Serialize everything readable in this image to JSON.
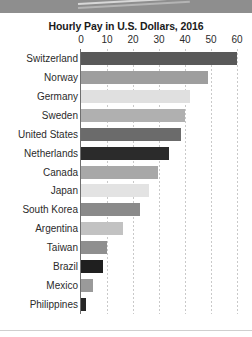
{
  "chart_data": {
    "type": "bar",
    "orientation": "horizontal",
    "title": "Hourly Pay in U.S. Dollars, 2016",
    "xlabel": "",
    "ylabel": "",
    "xlim": [
      0,
      60
    ],
    "xticks": [
      0,
      10,
      20,
      30,
      40,
      50,
      60
    ],
    "grid": true,
    "legend": "none",
    "categories": [
      "Switzerland",
      "Norway",
      "Germany",
      "Sweden",
      "United States",
      "Netherlands",
      "Canada",
      "Japan",
      "South Korea",
      "Argentina",
      "Taiwan",
      "Brazil",
      "Mexico",
      "Philippines"
    ],
    "values": [
      60,
      49,
      42,
      40,
      38.5,
      34,
      29.5,
      26,
      22.5,
      16,
      10,
      8.5,
      4.5,
      2
    ],
    "bar_colors": [
      "#595959",
      "#9e9e9e",
      "#e0e0e0",
      "#b0b0b0",
      "#6b6b6b",
      "#2b2b2b",
      "#a8a8a8",
      "#e3e3e3",
      "#8a8a8a",
      "#c2c2c2",
      "#8f8f8f",
      "#1f1f1f",
      "#9a9a9a",
      "#262626"
    ]
  },
  "axis": {
    "tick_labels": [
      "0",
      "10",
      "20",
      "30",
      "40",
      "50",
      "60"
    ]
  },
  "colors": {
    "axis_line": "#6f6f6f",
    "gridline": "#c9c9c9",
    "text": "#2b2b2b",
    "title": "#1a1a1a",
    "top_band": "#8e8e8e",
    "background": "#ffffff"
  }
}
